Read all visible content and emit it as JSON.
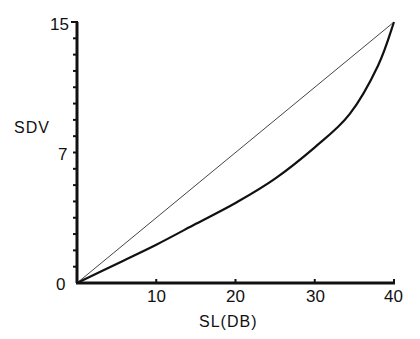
{
  "chart_data": {
    "type": "line",
    "title": "",
    "xlabel": "SL(DB)",
    "ylabel": "SDV",
    "xlim": [
      0,
      40
    ],
    "ylim": [
      0,
      15
    ],
    "x_ticks": [
      0,
      10,
      20,
      30,
      40
    ],
    "x_tick_labels": [
      "10",
      "20",
      "30",
      "40"
    ],
    "y_tick_labels": [
      "0",
      "7",
      "15"
    ],
    "y_minor_ticks": 16,
    "grid": false,
    "legend": null,
    "series": [
      {
        "name": "diagonal reference",
        "style": "thin",
        "x": [
          0,
          40
        ],
        "y": [
          0,
          15
        ]
      },
      {
        "name": "SDV curve",
        "style": "thick",
        "x": [
          0,
          5,
          10,
          15,
          20,
          25,
          30,
          34.4,
          38,
          40
        ],
        "y": [
          0,
          1.1,
          2.2,
          3.4,
          4.6,
          6.0,
          7.8,
          9.7,
          12.5,
          15
        ]
      }
    ]
  },
  "labels": {
    "origin": "0",
    "y_mid": "7",
    "y_top": "15",
    "x_10": "10",
    "x_20": "20",
    "x_30": "30",
    "x_40": "40",
    "xlabel": "SL(DB)",
    "ylabel": "SDV"
  }
}
